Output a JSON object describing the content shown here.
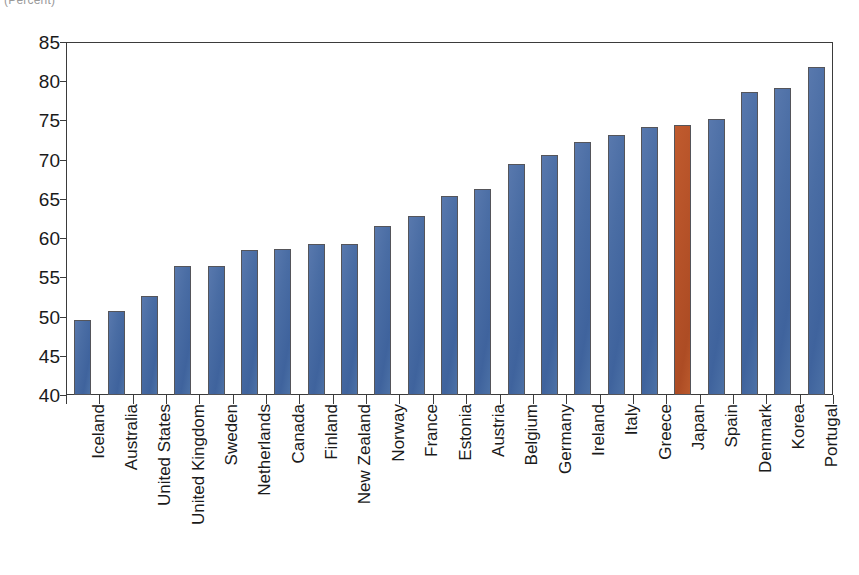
{
  "chart_data": {
    "type": "bar",
    "title": "",
    "subtitle": "",
    "unit_label": "(Percent)",
    "xlabel": "",
    "ylabel": "",
    "ylim": [
      40,
      85
    ],
    "ytick_step": 5,
    "yticks": [
      40,
      45,
      50,
      55,
      60,
      65,
      70,
      75,
      80,
      85
    ],
    "ytick_labels": [
      "40",
      "45",
      "50",
      "55",
      "60",
      "65",
      "70",
      "75",
      "80",
      "85"
    ],
    "grid": false,
    "legend": "none",
    "categories": [
      "Iceland",
      "Australia",
      "United States",
      "United Kingdom",
      "Sweden",
      "Netherlands",
      "Canada",
      "Finland",
      "New Zealand",
      "Norway",
      "France",
      "Estonia",
      "Austria",
      "Belgium",
      "Germany",
      "Ireland",
      "Italy",
      "Greece",
      "Japan",
      "Spain",
      "Denmark",
      "Korea",
      "Portugal"
    ],
    "values": [
      49.6,
      50.7,
      52.6,
      56.4,
      56.5,
      58.5,
      58.6,
      59.2,
      59.3,
      61.6,
      62.8,
      65.4,
      66.2,
      69.4,
      70.6,
      72.3,
      73.2,
      74.2,
      74.4,
      75.2,
      78.6,
      79.1,
      81.8
    ],
    "highlight_category": "Japan",
    "colors": {
      "bar": "#4a6da4",
      "bar_highlight": "#b75329",
      "bar_outline": "#55555a",
      "axis": "#3b3b3b",
      "text": "#1a1a1a",
      "background": "#ffffff"
    }
  }
}
